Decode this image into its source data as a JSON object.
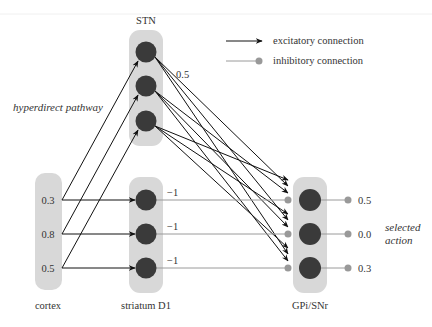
{
  "legend": {
    "excitatory": "excitatory connection",
    "inhibitory": "inhibitory connection"
  },
  "groups": {
    "stn": {
      "label": "STN",
      "nodes": 3
    },
    "cortex": {
      "label": "cortex",
      "values": [
        "0.3",
        "0.8",
        "0.5"
      ]
    },
    "striatum": {
      "label": "striatum D1",
      "weights": [
        "−1",
        "−1",
        "−1"
      ]
    },
    "gpi": {
      "label": "GPi/SNr",
      "outputs": [
        "0.5",
        "0.0",
        "0.3"
      ]
    }
  },
  "annotations": {
    "hyperdirect": "hyperdirect pathway",
    "stn_weight": "0.5",
    "selected_line1": "selected",
    "selected_line2": "action"
  },
  "colors": {
    "box": "#d8d8d8",
    "node": "#3a3a3a",
    "excitatory": "#111111",
    "inhibitory": "#9a9a9a"
  }
}
